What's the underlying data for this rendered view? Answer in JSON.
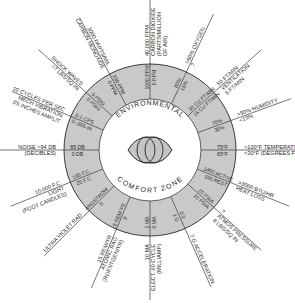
{
  "title": {
    "top": "ENVIRONMENTAL",
    "bottom": "COMFORT ZONE"
  },
  "colors": {
    "ring_fill": "#c9c9c9",
    "line": "#3a3a3a",
    "background": "#ffffff",
    "eye_fill": "#c4c4c4"
  },
  "spokes": [
    {
      "id": "noise",
      "angle": 180,
      "ring": [
        "85 DB",
        "0 DB"
      ],
      "outer": [
        "NOISE      >94 DB",
        "(DECIBLES)"
      ]
    },
    {
      "id": "mech-vibration",
      "angle": 203,
      "ring": [
        "0-1 CPS",
        "0-.005 IN"
      ],
      "outer": [
        "10 CYCLES PER SEC",
        "MECH VIBRATION",
        ".05 INCHES AMPLIT"
      ]
    },
    {
      "id": "shock-waves",
      "angle": 222,
      "ring": [
        "5 PSIG",
        "0 PSIG"
      ],
      "outer": [
        "SHOCK WAVES",
        ">7 LBS/SQ IN"
      ]
    },
    {
      "id": "carbon-monoxide",
      "angle": 242,
      "ring": [
        "100 PPM",
        "0 PPM"
      ],
      "outer": [
        "3000 PARTS/MIL",
        "CARBON MONOXIDE"
      ]
    },
    {
      "id": "carbon-dioxide",
      "angle": 270,
      "ring": [
        "1000 PPM",
        "0 PPM"
      ],
      "outer": [
        "40,000 PPM",
        "CARBON DIOXIDE",
        "(PARTS/MILLION",
        "OF AIR)"
      ]
    },
    {
      "id": "oxygen",
      "angle": 295,
      "ring": [
        "80%",
        "15%"
      ],
      "outer": [
        ">60%  OXYGEN",
        "?"
      ]
    },
    {
      "id": "ventilation",
      "angle": 318,
      "ring": [
        "30 CU FT/MIN",
        "15 CU FT/MIN"
      ],
      "outer": [
        "50 FT/MIN",
        "VENTILATION",
        "5 FT/MIN"
      ]
    },
    {
      "id": "humidity",
      "angle": 340,
      "ring": [
        "70%",
        "30%"
      ],
      "outer": [
        ">90%  HUMIDITY",
        "<10%"
      ]
    },
    {
      "id": "temperature",
      "angle": 0,
      "ring": [
        "75°F",
        "65°F"
      ],
      "outer": [
        ">100°F TEMPERATURE",
        "<30°F  (DEGREES F)"
      ]
    },
    {
      "id": "heat-loss",
      "angle": 22,
      "ring": [
        "1450 ACTIVE",
        "330 REST"
      ],
      "outer": [
        ">3000 BTU/HR",
        "HEAT LOSS"
      ]
    },
    {
      "id": "atmos-pressure",
      "angle": 42,
      "ring": [
        "20 PSIA",
        "10 PSIA"
      ],
      "outer": [
        "?",
        "ATMOS PRESSURE",
        "8 LBS/SQ IN"
      ]
    },
    {
      "id": "acceleration",
      "angle": 66,
      "ring": [
        "0.0",
        "1 G"
      ],
      "outer": [
        "7 G  ACCELERATION"
      ]
    },
    {
      "id": "elect-60-cycle",
      "angle": 90,
      "ring": [
        "1 MA",
        "0 MA"
      ],
      "outer": [
        "10 MA",
        "ELECT. 60 CYCLE",
        "(MILLIAMP)"
      ]
    },
    {
      "id": "atomic-rad",
      "angle": 113,
      "ring": [
        ".5 REM/YR",
        "0"
      ],
      "outer": [
        "15 REM/YR",
        "ATOMIC RAD",
        "(ROENTGEN/YR)"
      ]
    },
    {
      "id": "ultra-violet",
      "angle": 135,
      "ring": [
        "ANGSTROM",
        "0"
      ],
      "outer": [
        "ULTRA VIOLET RAD"
      ]
    },
    {
      "id": "light",
      "angle": 158,
      "ring": [
        "100 F.C.",
        "20 F.C."
      ],
      "outer": [
        "10,000 F.C.",
        "LIGHT",
        "(FOOT CANDLES)"
      ]
    }
  ]
}
